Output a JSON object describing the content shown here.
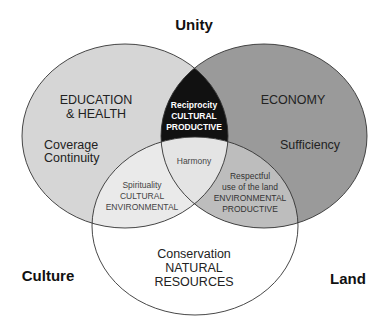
{
  "diagram": {
    "type": "venn",
    "corner_labels": {
      "top": "Unity",
      "bottom_left": "Culture",
      "bottom_right": "Land"
    },
    "sets": {
      "left": {
        "title": [
          "EDUCATION",
          "& HEALTH"
        ],
        "subtitle": [
          "Coverage",
          "Continuity"
        ],
        "fill": "#d6d6d6"
      },
      "right": {
        "title": [
          "ECONOMY"
        ],
        "subtitle": [
          "Sufficiency"
        ],
        "fill": "#9a9a9a"
      },
      "bottom": {
        "title": [
          "Conservation",
          "NATURAL",
          "RESOURCES"
        ],
        "fill": "#ffffff"
      }
    },
    "intersections": {
      "left_right": {
        "lines": [
          "Reciprocity",
          "CULTURAL",
          "PRODUCTIVE"
        ],
        "fill": "#111111"
      },
      "left_bottom": {
        "lines": [
          "Spirituality",
          "CULTURAL",
          "ENVIRONMENTAL"
        ],
        "fill": "#eaeaea"
      },
      "right_bottom": {
        "lines": [
          "Respectful",
          "use of the land",
          "ENVIRONMENTAL",
          "PRODUCTIVE"
        ],
        "fill": "#bdbdbd"
      },
      "center": {
        "lines": [
          "Harmony"
        ],
        "fill": "#e4e4e4"
      }
    }
  }
}
